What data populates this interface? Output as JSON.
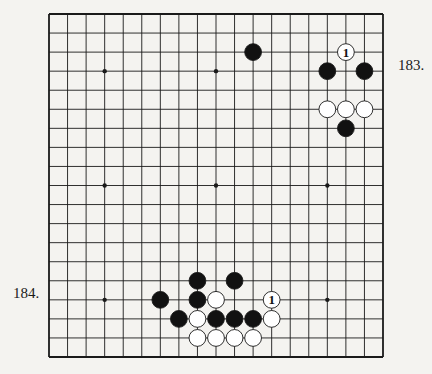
{
  "diagram": {
    "type": "go-board",
    "size": 19,
    "colors": {
      "paper": "#f4f3f0",
      "line": "#1a1a1a",
      "black_stone": "#111111",
      "white_stone": "#ffffff"
    },
    "hoshi": [
      [
        3,
        3
      ],
      [
        9,
        3
      ],
      [
        15,
        3
      ],
      [
        3,
        9
      ],
      [
        9,
        9
      ],
      [
        15,
        9
      ],
      [
        3,
        15
      ],
      [
        9,
        15
      ],
      [
        15,
        15
      ]
    ],
    "stones": [
      {
        "color": "black",
        "col": 11,
        "row": 2
      },
      {
        "color": "white",
        "col": 16,
        "row": 2,
        "label": "1"
      },
      {
        "color": "black",
        "col": 15,
        "row": 3
      },
      {
        "color": "black",
        "col": 17,
        "row": 3
      },
      {
        "color": "white",
        "col": 15,
        "row": 5
      },
      {
        "color": "white",
        "col": 16,
        "row": 5
      },
      {
        "color": "white",
        "col": 17,
        "row": 5
      },
      {
        "color": "black",
        "col": 16,
        "row": 6
      },
      {
        "color": "black",
        "col": 8,
        "row": 14
      },
      {
        "color": "black",
        "col": 10,
        "row": 14
      },
      {
        "color": "black",
        "col": 6,
        "row": 15
      },
      {
        "color": "black",
        "col": 8,
        "row": 15
      },
      {
        "color": "white",
        "col": 9,
        "row": 15
      },
      {
        "color": "white",
        "col": 12,
        "row": 15,
        "label": "1"
      },
      {
        "color": "black",
        "col": 7,
        "row": 16
      },
      {
        "color": "white",
        "col": 8,
        "row": 16
      },
      {
        "color": "black",
        "col": 9,
        "row": 16
      },
      {
        "color": "black",
        "col": 10,
        "row": 16
      },
      {
        "color": "black",
        "col": 11,
        "row": 16
      },
      {
        "color": "white",
        "col": 12,
        "row": 16
      },
      {
        "color": "white",
        "col": 8,
        "row": 17
      },
      {
        "color": "white",
        "col": 9,
        "row": 17
      },
      {
        "color": "white",
        "col": 10,
        "row": 17
      },
      {
        "color": "white",
        "col": 11,
        "row": 17
      }
    ]
  },
  "labels": {
    "problem_183": "183.",
    "problem_184": "184."
  }
}
